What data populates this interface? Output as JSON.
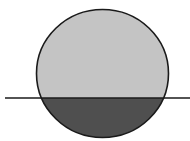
{
  "diagram": {
    "type": "circle-cut-by-horizontal-line",
    "circle": {
      "cx": 102.5,
      "cy": 73.5,
      "rx": 66,
      "ry": 64
    },
    "line_y": 98,
    "line_x_start": 5,
    "line_x_end": 190,
    "colors": {
      "background": "#ffffff",
      "upper_fill": "#c4c4c4",
      "lower_fill": "#4f4f4f",
      "stroke": "#1a1a1a"
    }
  }
}
